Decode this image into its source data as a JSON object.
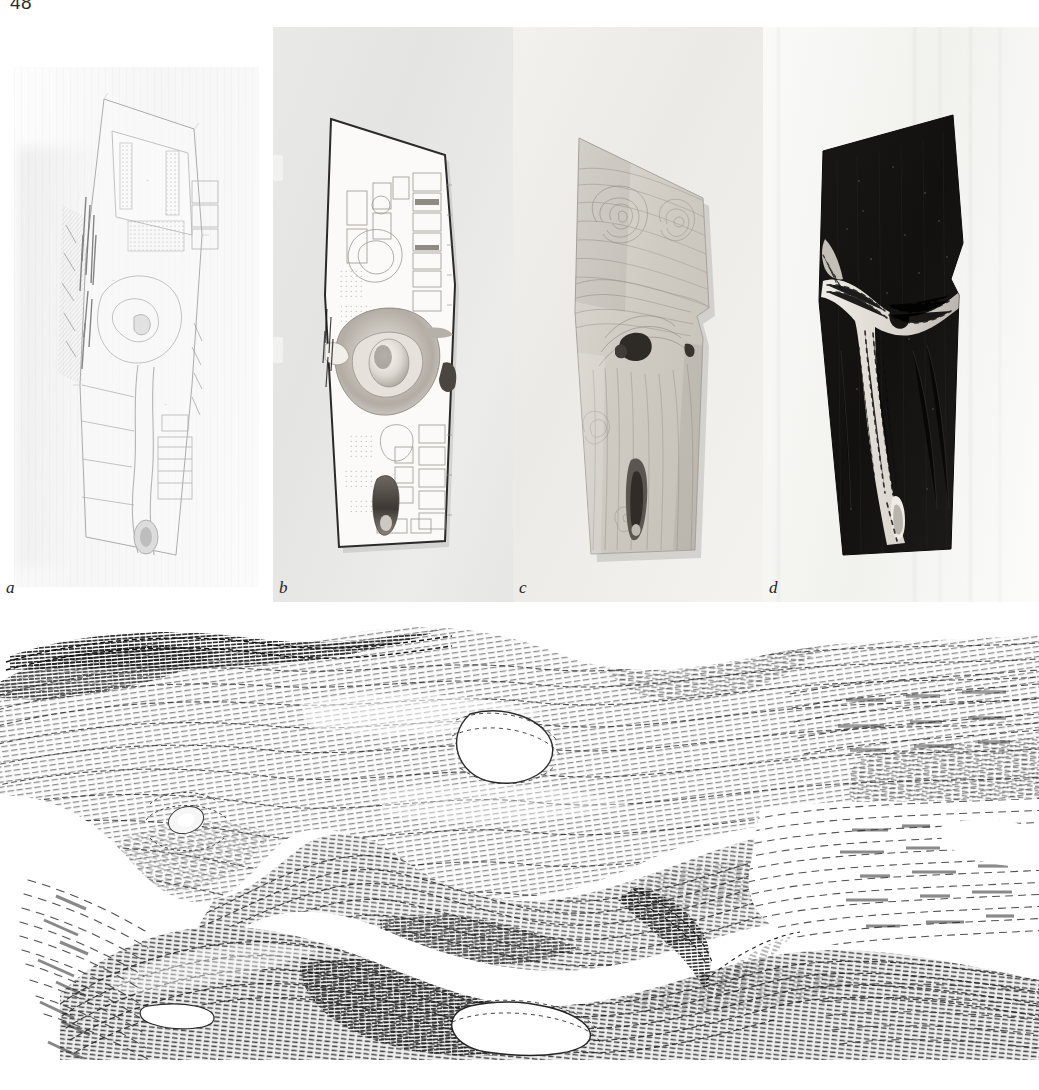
{
  "page": {
    "folio": "48",
    "background_color": "#ffffff"
  },
  "figure_top": {
    "panels": [
      {
        "id": "a",
        "label": "a",
        "kind": "architectural-site-plan-drawing",
        "description": "Faded line-drawn site plan, pale gray on white paper",
        "background_color": "#ffffff"
      },
      {
        "id": "b",
        "label": "b",
        "kind": "printed-plan-model-photograph",
        "description": "Pentagonal plan sheet with interior layout photographed on gray ground",
        "background_color": "#ebebeb"
      },
      {
        "id": "c",
        "label": "c",
        "kind": "carved-board-model-photograph",
        "description": "Carved wooden board with swirling contour grain and two dark voids",
        "background_color": "#efeeec"
      },
      {
        "id": "d",
        "label": "d",
        "kind": "inverted-dark-model-photograph",
        "description": "Dark board with bright branching channel and dashed hatching",
        "background_color": "#fbfbfa"
      }
    ]
  },
  "figure_bottom": {
    "label": "",
    "kind": "hatched-3d-surface-rendering",
    "description": "Dense stroke-hatched rendering of a continuous organic shell with apertures",
    "background_color": "#ffffff",
    "ink_color": "#2b2b2b"
  },
  "colors": {
    "paper": "#ffffff",
    "panel_b_ground": "#ebebeb",
    "panel_c_ground": "#efeeec",
    "panel_d_ground": "#fbfbfa",
    "ink": "#232323",
    "dark_board": "#151515"
  }
}
